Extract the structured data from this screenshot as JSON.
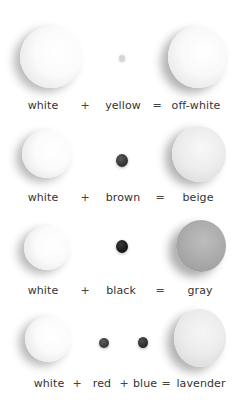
{
  "rows": [
    {
      "base": {
        "name": "white",
        "color": "#f7f7f7"
      },
      "additives": [
        {
          "name": "yellow",
          "color": "#d9d9d9"
        }
      ],
      "result": {
        "name": "off-white",
        "color": "#f2f2f2"
      },
      "ops": [
        "+",
        "="
      ]
    },
    {
      "base": {
        "name": "white",
        "color": "#f7f7f7"
      },
      "additives": [
        {
          "name": "brown",
          "color": "#3d3d3d"
        }
      ],
      "result": {
        "name": "beige",
        "color": "#e6e6e6"
      },
      "ops": [
        "+",
        "="
      ]
    },
    {
      "base": {
        "name": "white",
        "color": "#f7f7f7"
      },
      "additives": [
        {
          "name": "black",
          "color": "#1e1e1e"
        }
      ],
      "result": {
        "name": "gray",
        "color": "#a8a8a8"
      },
      "ops": [
        "+",
        "="
      ]
    },
    {
      "base": {
        "name": "white",
        "color": "#f7f7f7"
      },
      "additives": [
        {
          "name": "red",
          "color": "#4a4a4a"
        },
        {
          "name": "blue",
          "color": "#3a3a3a"
        }
      ],
      "result": {
        "name": "lavender",
        "color": "#e9e9e9"
      },
      "ops": [
        "+",
        "+",
        "="
      ]
    }
  ]
}
